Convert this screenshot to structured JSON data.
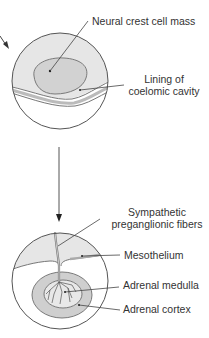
{
  "diagram": {
    "colors": {
      "stroke": "#555555",
      "fill_light": "#e8e8e8",
      "fill_mid": "#cfcfcf",
      "fill_dark": "#b8b8b8",
      "text": "#333333",
      "background": "#ffffff"
    },
    "top_panel": {
      "labels": {
        "neural_crest": "Neural crest cell mass",
        "lining_line1": "Lining of",
        "lining_line2": "coelomic cavity"
      }
    },
    "arrow": {
      "direction": "down"
    },
    "bottom_panel": {
      "labels": {
        "sympathetic_line1": "Sympathetic",
        "sympathetic_line2": "preganglionic fibers",
        "mesothelium": "Mesothelium",
        "adrenal_medulla": "Adrenal medulla",
        "adrenal_cortex": "Adrenal cortex"
      }
    }
  }
}
